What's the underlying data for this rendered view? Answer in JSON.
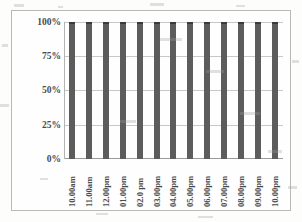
{
  "chart_data": {
    "type": "bar",
    "title": "",
    "subtitle": "",
    "xlabel": "",
    "ylabel": "Efficiency",
    "categories": [
      "10.00am",
      "11.00am",
      "12.00pm",
      "01.00pm",
      "02.0 pm",
      "03.00pm",
      "04.00pm",
      "05.00pm",
      "06.00pm",
      "07.00pm",
      "08.00pm",
      "09.00pm",
      "10.00pm"
    ],
    "values": [
      100,
      100,
      100,
      100,
      100,
      100,
      100,
      100,
      100,
      100,
      100,
      100,
      100
    ],
    "value_unit": "%",
    "ylim": [
      0,
      100
    ],
    "y_ticks": [
      0,
      25,
      50,
      75,
      100
    ],
    "y_tick_labels": [
      "0%",
      "25%",
      "50%",
      "75%",
      "100%"
    ],
    "grid": true,
    "grid_axis": "y",
    "legend": false,
    "legend_position": "none",
    "bar_color": "#5c5c5c",
    "bar_cap_color": "#3a3a3a",
    "gridline_color": "#c8c8c4",
    "axis_color": "#b3b3af",
    "frame_color": "#b9b9b6",
    "background_color": "#fefefe",
    "x_label_rotation": 90
  }
}
